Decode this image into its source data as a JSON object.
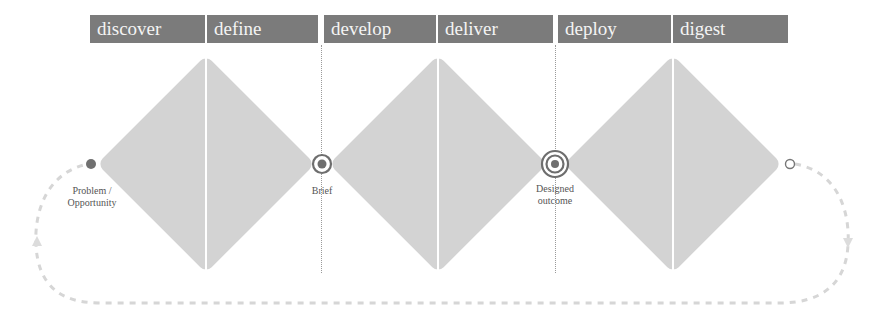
{
  "diagram": {
    "type": "double-diamond-extended",
    "phases": [
      {
        "label": "discover",
        "group": 1
      },
      {
        "label": "define",
        "group": 1
      },
      {
        "label": "develop",
        "group": 2
      },
      {
        "label": "deliver",
        "group": 2
      },
      {
        "label": "deploy",
        "group": 3
      },
      {
        "label": "digest",
        "group": 3
      }
    ],
    "milestones": [
      {
        "id": "start",
        "label": "Problem /\nOpportunity",
        "label_line1": "Problem /",
        "label_line2": "Opportunity",
        "marker": "filled-dot"
      },
      {
        "id": "brief",
        "label": "Brief",
        "marker": "target-2-ring"
      },
      {
        "id": "designed-outcome",
        "label": "Designed\noutcome",
        "label_line1": "Designed",
        "label_line2": "outcome",
        "marker": "target-3-ring"
      },
      {
        "id": "end",
        "label": "",
        "marker": "hollow-circle"
      }
    ],
    "loop": {
      "style": "dashed-return-path",
      "direction": "end-to-start"
    },
    "colors": {
      "header_bg": "#7b7b7b",
      "header_text": "#f4f4f4",
      "diamond_fill": "#d3d3d3",
      "marker": "#666666",
      "loop_dash": "#d6d6d6"
    }
  }
}
